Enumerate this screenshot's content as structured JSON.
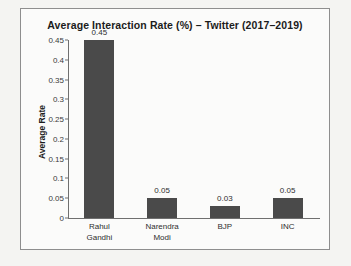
{
  "chart_data": {
    "type": "bar",
    "title": "Average Interaction Rate (%) – Twitter (2017–2019)",
    "xlabel": "",
    "ylabel": "Average Rate",
    "categories": [
      "Rahul Gandhi",
      "Narendra Modi",
      "BJP",
      "INC"
    ],
    "values": [
      0.45,
      0.05,
      0.03,
      0.05
    ],
    "value_labels": [
      "0.45",
      "0.05",
      "0.03",
      "0.05"
    ],
    "ylim": [
      0,
      0.45
    ],
    "ytick_values": [
      0,
      0.05,
      0.1,
      0.15,
      0.2,
      0.25,
      0.3,
      0.35,
      0.4,
      0.45
    ],
    "ytick_labels": [
      "0",
      "0.05",
      "0.1",
      "0.15",
      "0.2",
      "0.25",
      "0.3",
      "0.35",
      "0.4",
      "0.45"
    ],
    "grid": false,
    "legend": null,
    "bar_color": "#4a4a4a",
    "axis_color": "#6f6f6f",
    "frame_color": "#8e8e8e",
    "background_color": "#fbfbfa",
    "page_background": "#f4f4f2",
    "category_lines": [
      [
        "Rahul",
        "Gandhi"
      ],
      [
        "Narendra",
        "Modi"
      ],
      [
        "BJP"
      ],
      [
        "INC"
      ]
    ]
  }
}
